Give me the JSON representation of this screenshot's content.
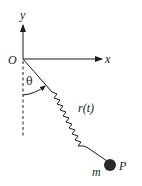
{
  "diagram": {
    "labels": {
      "origin": "O",
      "y_axis": "y",
      "x_axis": "x",
      "angle": "θ",
      "spring_length": "r(t)",
      "mass": "m",
      "point": "P"
    },
    "colors": {
      "ink": "#1a1a1a",
      "background": "#ffffff",
      "mass_fill": "#2a2a2a"
    }
  }
}
